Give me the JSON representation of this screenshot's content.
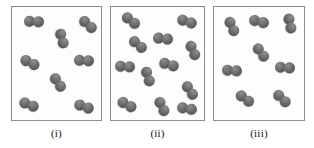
{
  "figure": {
    "background_color": "#ffffff",
    "panel_border_color": "#8c8c8c",
    "panel_fill_color": "#fdfdfd",
    "atom_color": "#5e5e5e",
    "molecule_type": "diatomic"
  },
  "panels": [
    {
      "id": "panel-i",
      "label": "(i)",
      "molecule_count": 8,
      "box": {
        "x": 11,
        "y": 6,
        "w": 91,
        "h": 115
      },
      "label_x": 11,
      "label_w": 91,
      "molecules": [
        {
          "x": 12,
          "y": 9,
          "rot": 3
        },
        {
          "x": 66,
          "y": 12,
          "rot": 42
        },
        {
          "x": 40,
          "y": 26,
          "rot": 74
        },
        {
          "x": 8,
          "y": 50,
          "rot": 26
        },
        {
          "x": 62,
          "y": 48,
          "rot": 2
        },
        {
          "x": 36,
          "y": 70,
          "rot": 56
        },
        {
          "x": 7,
          "y": 92,
          "rot": 22
        },
        {
          "x": 62,
          "y": 94,
          "rot": 20
        }
      ]
    },
    {
      "id": "panel-ii",
      "label": "(ii)",
      "molecule_count": 12,
      "box": {
        "x": 110,
        "y": 6,
        "w": 95,
        "h": 115
      },
      "label_x": 110,
      "label_w": 95,
      "molecules": [
        {
          "x": 10,
          "y": 8,
          "rot": 38
        },
        {
          "x": 66,
          "y": 9,
          "rot": 18
        },
        {
          "x": 42,
          "y": 26,
          "rot": 6
        },
        {
          "x": 17,
          "y": 32,
          "rot": 40
        },
        {
          "x": 72,
          "y": 38,
          "rot": 66
        },
        {
          "x": 4,
          "y": 54,
          "rot": 4
        },
        {
          "x": 48,
          "y": 52,
          "rot": 16
        },
        {
          "x": 27,
          "y": 64,
          "rot": 72
        },
        {
          "x": 69,
          "y": 78,
          "rot": 56
        },
        {
          "x": 6,
          "y": 92,
          "rot": 28
        },
        {
          "x": 41,
          "y": 94,
          "rot": 64
        },
        {
          "x": 66,
          "y": 96,
          "rot": 10
        }
      ]
    },
    {
      "id": "panel-iii",
      "label": "(iii)",
      "molecule_count": 8,
      "box": {
        "x": 213,
        "y": 6,
        "w": 92,
        "h": 115
      },
      "label_x": 213,
      "label_w": 92,
      "molecules": [
        {
          "x": 8,
          "y": 14,
          "rot": 66
        },
        {
          "x": 35,
          "y": 9,
          "rot": 14
        },
        {
          "x": 66,
          "y": 11,
          "rot": 78
        },
        {
          "x": 37,
          "y": 40,
          "rot": 54
        },
        {
          "x": 61,
          "y": 55,
          "rot": 4
        },
        {
          "x": 8,
          "y": 58,
          "rot": 4
        },
        {
          "x": 21,
          "y": 86,
          "rot": 36
        },
        {
          "x": 58,
          "y": 86,
          "rot": 44
        }
      ]
    }
  ],
  "caption_row": {
    "y": 126
  }
}
